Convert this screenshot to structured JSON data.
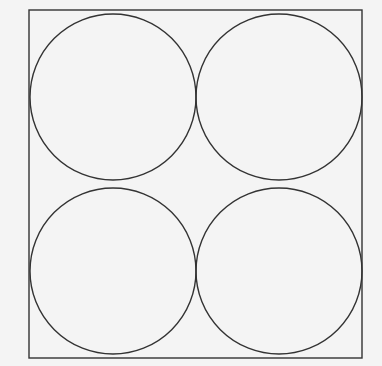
{
  "diagram": {
    "background": "#f4f4f4",
    "stroke": "#333333",
    "square": {
      "x": 29,
      "y": 10,
      "width": 333,
      "height": 348
    },
    "circles": [
      {
        "cx": 113,
        "cy": 97,
        "r": 83
      },
      {
        "cx": 279,
        "cy": 97,
        "r": 83
      },
      {
        "cx": 113,
        "cy": 271,
        "r": 83
      },
      {
        "cx": 279,
        "cy": 271,
        "r": 83
      }
    ]
  }
}
